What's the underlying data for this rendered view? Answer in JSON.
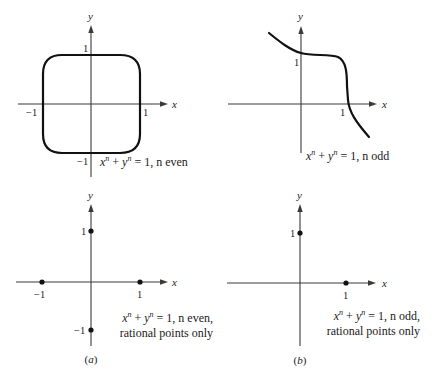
{
  "figure": {
    "panels": [
      {
        "id": "top-left",
        "x_axis_label": "x",
        "y_axis_label": "y",
        "tick_labels": {
          "x_pos": "1",
          "x_neg": "−1",
          "y_pos": "1",
          "y_neg": "−1"
        },
        "equation": {
          "lhs_x": "x",
          "exp_x": "n",
          "plus": "+",
          "lhs_y": "y",
          "exp_y": "n",
          "rhs": "=  1, n even"
        },
        "description": "Closed superellipse curve through (±1,0) and (0,±1)"
      },
      {
        "id": "top-right",
        "x_axis_label": "x",
        "y_axis_label": "y",
        "tick_labels": {
          "x_pos": "1",
          "y_pos": "1"
        },
        "equation": {
          "lhs_x": "x",
          "exp_x": "n",
          "plus": "+",
          "lhs_y": "y",
          "exp_y": "n",
          "rhs": "=  1, n odd"
        },
        "description": "Open curve through (0,1) and (1,0), descending from upper-left to lower-right"
      },
      {
        "id": "bottom-left",
        "x_axis_label": "x",
        "y_axis_label": "y",
        "tick_labels": {
          "x_pos": "1",
          "x_neg": "−1",
          "y_pos": "1",
          "y_neg": "−1"
        },
        "equation": {
          "lhs_x": "x",
          "exp_x": "n",
          "plus": "+",
          "lhs_y": "y",
          "exp_y": "n",
          "rhs": "=   1, n even,",
          "line2": "rational points only"
        },
        "points": [
          [
            1,
            0
          ],
          [
            -1,
            0
          ],
          [
            0,
            1
          ],
          [
            0,
            -1
          ]
        ],
        "caption_prefix": "(",
        "caption_letter": "a",
        "caption_suffix": ")"
      },
      {
        "id": "bottom-right",
        "x_axis_label": "x",
        "y_axis_label": "y",
        "tick_labels": {
          "x_pos": "1",
          "y_pos": "1"
        },
        "equation": {
          "lhs_x": "x",
          "exp_x": "n",
          "plus": "+",
          "lhs_y": "y",
          "exp_y": "n",
          "rhs": "=    1, n odd,",
          "line2": "rational points only"
        },
        "points": [
          [
            1,
            0
          ],
          [
            0,
            1
          ]
        ],
        "caption_prefix": "(",
        "caption_letter": "b",
        "caption_suffix": ")"
      }
    ]
  }
}
